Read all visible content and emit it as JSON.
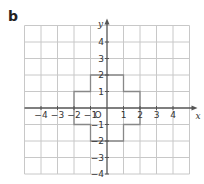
{
  "part_label": "b",
  "axes": {
    "x_label": "x",
    "y_label": "y",
    "origin_label": "O",
    "x_ticks": [
      "−4",
      "−3",
      "−2",
      "−1",
      "1",
      "2",
      "3",
      "4"
    ],
    "x_tick_values": [
      -4,
      -3,
      -2,
      -1,
      1,
      2,
      3,
      4
    ],
    "y_ticks": [
      "4",
      "3",
      "2",
      "1",
      "−1",
      "−2",
      "−3",
      "−4"
    ],
    "y_tick_values": [
      4,
      3,
      2,
      1,
      -1,
      -2,
      -3,
      -4
    ],
    "x_range": [
      -5,
      5
    ],
    "y_range": [
      -4,
      5
    ]
  },
  "shape": {
    "name": "cross-shaped polygon",
    "vertices": [
      [
        -2,
        1
      ],
      [
        -1,
        1
      ],
      [
        -1,
        2
      ],
      [
        1,
        2
      ],
      [
        1,
        1
      ],
      [
        2,
        1
      ],
      [
        2,
        -1
      ],
      [
        1,
        -1
      ],
      [
        1,
        -2
      ],
      [
        -1,
        -2
      ],
      [
        -1,
        -1
      ],
      [
        -2,
        -1
      ]
    ]
  },
  "colors": {
    "grid": "#c8c8c8",
    "axis": "#555555",
    "shape": "#888888"
  }
}
